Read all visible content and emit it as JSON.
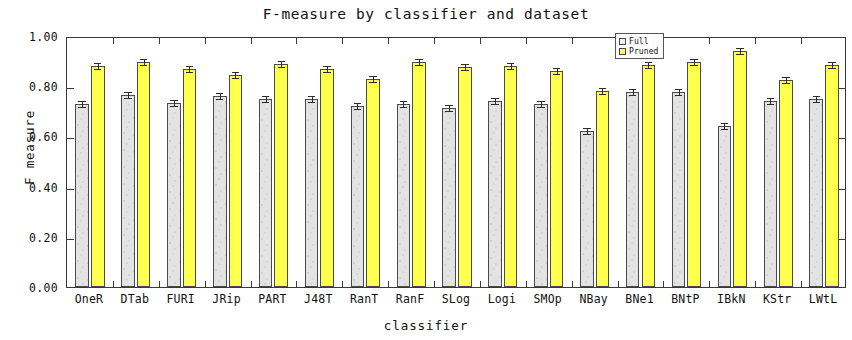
{
  "chart_data": {
    "type": "bar",
    "title": "F-measure by classifier and dataset",
    "xlabel": "classifier",
    "ylabel": "F measure",
    "ylim": [
      0.0,
      1.0
    ],
    "ytick_labels": [
      "0.00",
      "0.20",
      "0.40",
      "0.60",
      "0.80",
      "1.00"
    ],
    "ytick_values": [
      0.0,
      0.2,
      0.4,
      0.6,
      0.8,
      1.0
    ],
    "grid": false,
    "legend_position": "top-right-inside",
    "error_bars": true,
    "categories": [
      "OneR",
      "DTab",
      "FURI",
      "JRip",
      "PART",
      "J48T",
      "RanT",
      "RanF",
      "SLog",
      "Logi",
      "SMOp",
      "NBay",
      "BNe1",
      "BNtP",
      "IBkN",
      "KStr",
      "LWtL"
    ],
    "series": [
      {
        "name": "Full",
        "color": "#e3e3e3",
        "values": [
          0.73,
          0.765,
          0.735,
          0.76,
          0.75,
          0.75,
          0.72,
          0.73,
          0.715,
          0.74,
          0.73,
          0.62,
          0.775,
          0.775,
          0.64,
          0.74,
          0.75
        ],
        "errors": [
          0.012,
          0.012,
          0.012,
          0.012,
          0.012,
          0.012,
          0.012,
          0.012,
          0.012,
          0.012,
          0.012,
          0.012,
          0.012,
          0.012,
          0.012,
          0.012,
          0.012
        ]
      },
      {
        "name": "Pruned",
        "color": "#ffff4d",
        "values": [
          0.88,
          0.895,
          0.87,
          0.845,
          0.89,
          0.87,
          0.83,
          0.895,
          0.875,
          0.88,
          0.86,
          0.78,
          0.885,
          0.897,
          0.94,
          0.825,
          0.885
        ],
        "errors": [
          0.012,
          0.012,
          0.012,
          0.012,
          0.012,
          0.012,
          0.012,
          0.012,
          0.012,
          0.012,
          0.012,
          0.012,
          0.012,
          0.012,
          0.012,
          0.012,
          0.012
        ]
      }
    ]
  },
  "legend": {
    "items": [
      {
        "label": "Full"
      },
      {
        "label": "Pruned"
      }
    ]
  }
}
